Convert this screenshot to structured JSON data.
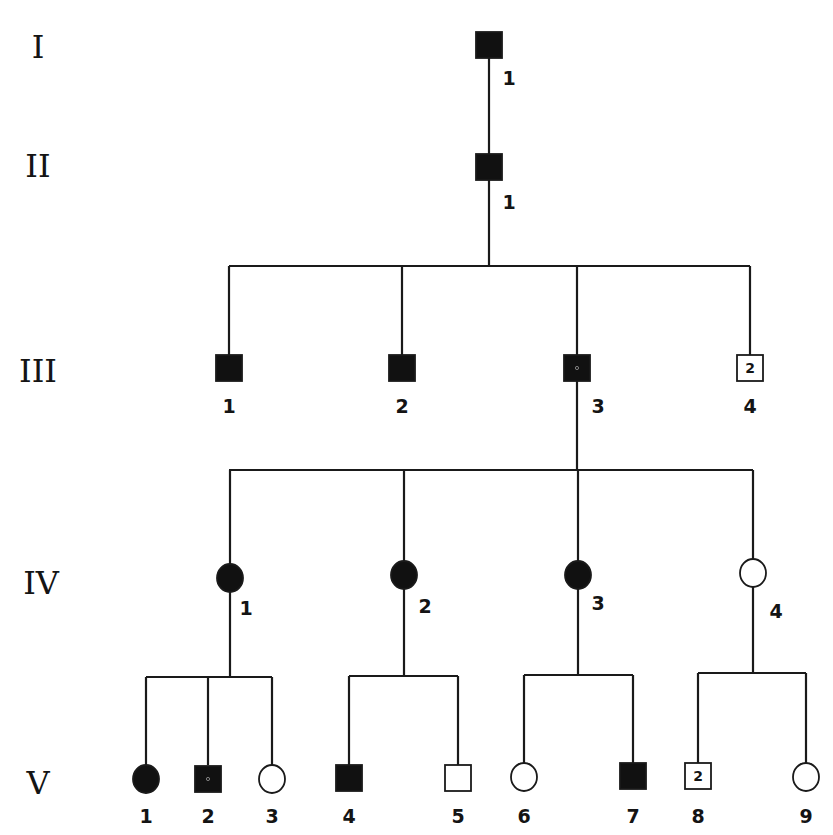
{
  "figure": {
    "type": "pedigree",
    "background": "#ffffff",
    "ink": "#111111"
  },
  "generations": [
    {
      "label": "I",
      "x": 38,
      "y": 58
    },
    {
      "label": "II",
      "x": 38,
      "y": 177
    },
    {
      "label": "III",
      "x": 38,
      "y": 382
    },
    {
      "label": "IV",
      "x": 41,
      "y": 594
    },
    {
      "label": "V",
      "x": 38,
      "y": 794
    }
  ],
  "individuals": [
    {
      "id": "I-1",
      "number": "1",
      "sex": "male",
      "affected": true,
      "x": 489,
      "y": 45,
      "label_x": 509,
      "label_y": 85
    },
    {
      "id": "II-1",
      "number": "1",
      "sex": "male",
      "affected": true,
      "x": 489,
      "y": 167,
      "label_x": 509,
      "label_y": 209
    },
    {
      "id": "III-1",
      "number": "1",
      "sex": "male",
      "affected": true,
      "x": 229,
      "y": 368,
      "label_x": 229,
      "label_y": 413
    },
    {
      "id": "III-2",
      "number": "2",
      "sex": "male",
      "affected": true,
      "x": 402,
      "y": 368,
      "label_x": 402,
      "label_y": 413
    },
    {
      "id": "III-3",
      "number": "3",
      "sex": "male",
      "affected": true,
      "x": 577,
      "y": 368,
      "label_x": 598,
      "label_y": 413,
      "dot": true
    },
    {
      "id": "III-4",
      "number": "4",
      "sex": "male",
      "affected": false,
      "x": 750,
      "y": 368,
      "label_x": 750,
      "label_y": 413,
      "inner": "2"
    },
    {
      "id": "IV-1",
      "number": "1",
      "sex": "female",
      "affected": true,
      "x": 230,
      "y": 578,
      "label_x": 246,
      "label_y": 615
    },
    {
      "id": "IV-2",
      "number": "2",
      "sex": "female",
      "affected": true,
      "x": 404,
      "y": 575,
      "label_x": 425,
      "label_y": 613
    },
    {
      "id": "IV-3",
      "number": "3",
      "sex": "female",
      "affected": true,
      "x": 578,
      "y": 575,
      "label_x": 598,
      "label_y": 610
    },
    {
      "id": "IV-4",
      "number": "4",
      "sex": "female",
      "affected": false,
      "x": 753,
      "y": 573,
      "label_x": 776,
      "label_y": 618
    },
    {
      "id": "V-1",
      "number": "1",
      "sex": "female",
      "affected": true,
      "x": 146,
      "y": 779,
      "label_x": 146,
      "label_y": 823
    },
    {
      "id": "V-2",
      "number": "2",
      "sex": "male",
      "affected": true,
      "x": 208,
      "y": 779,
      "label_x": 208,
      "label_y": 823,
      "dot": true
    },
    {
      "id": "V-3",
      "number": "3",
      "sex": "female",
      "affected": false,
      "x": 272,
      "y": 779,
      "label_x": 272,
      "label_y": 823
    },
    {
      "id": "V-4",
      "number": "4",
      "sex": "male",
      "affected": true,
      "x": 349,
      "y": 778,
      "label_x": 349,
      "label_y": 823
    },
    {
      "id": "V-5",
      "number": "5",
      "sex": "male",
      "affected": false,
      "x": 458,
      "y": 778,
      "label_x": 458,
      "label_y": 823
    },
    {
      "id": "V-6",
      "number": "6",
      "sex": "female",
      "affected": false,
      "x": 524,
      "y": 777,
      "label_x": 524,
      "label_y": 823
    },
    {
      "id": "V-7",
      "number": "7",
      "sex": "male",
      "affected": true,
      "x": 633,
      "y": 776,
      "label_x": 633,
      "label_y": 823
    },
    {
      "id": "V-8",
      "number": "8",
      "sex": "male",
      "affected": false,
      "x": 698,
      "y": 776,
      "label_x": 698,
      "label_y": 823,
      "inner": "2"
    },
    {
      "id": "V-9",
      "number": "9",
      "sex": "female",
      "affected": false,
      "x": 806,
      "y": 777,
      "label_x": 806,
      "label_y": 823
    }
  ],
  "lines": [
    {
      "name": "I1-to-II1",
      "x1": 489,
      "y1": 58,
      "x2": 489,
      "y2": 154
    },
    {
      "name": "II1-descent",
      "x1": 489,
      "y1": 180,
      "x2": 489,
      "y2": 266
    },
    {
      "name": "gen3-sibship",
      "x1": 229,
      "y1": 266,
      "x2": 750,
      "y2": 266
    },
    {
      "name": "III1-drop",
      "x1": 229,
      "y1": 266,
      "x2": 229,
      "y2": 355
    },
    {
      "name": "III2-drop",
      "x1": 402,
      "y1": 266,
      "x2": 402,
      "y2": 355
    },
    {
      "name": "III3-drop",
      "x1": 577,
      "y1": 266,
      "x2": 577,
      "y2": 355
    },
    {
      "name": "III4-drop",
      "x1": 750,
      "y1": 266,
      "x2": 750,
      "y2": 355
    },
    {
      "name": "III3-descent",
      "x1": 577,
      "y1": 381,
      "x2": 577,
      "y2": 470
    },
    {
      "name": "gen4-sibship",
      "x1": 229,
      "y1": 470,
      "x2": 753,
      "y2": 470
    },
    {
      "name": "IV1-drop",
      "x1": 230,
      "y1": 470,
      "x2": 230,
      "y2": 565
    },
    {
      "name": "IV2-drop",
      "x1": 404,
      "y1": 470,
      "x2": 404,
      "y2": 562
    },
    {
      "name": "IV3-drop",
      "x1": 578,
      "y1": 470,
      "x2": 578,
      "y2": 562
    },
    {
      "name": "IV4-drop",
      "x1": 753,
      "y1": 470,
      "x2": 753,
      "y2": 560
    },
    {
      "name": "IV1-descent",
      "x1": 230,
      "y1": 591,
      "x2": 230,
      "y2": 677
    },
    {
      "name": "IV1-sibship",
      "x1": 146,
      "y1": 677,
      "x2": 272,
      "y2": 677
    },
    {
      "name": "V1-drop",
      "x1": 146,
      "y1": 677,
      "x2": 146,
      "y2": 766
    },
    {
      "name": "V2-drop",
      "x1": 208,
      "y1": 677,
      "x2": 208,
      "y2": 765
    },
    {
      "name": "V3-drop",
      "x1": 272,
      "y1": 677,
      "x2": 272,
      "y2": 766
    },
    {
      "name": "IV2-descent",
      "x1": 404,
      "y1": 588,
      "x2": 404,
      "y2": 676
    },
    {
      "name": "IV2-sibship",
      "x1": 349,
      "y1": 676,
      "x2": 458,
      "y2": 676
    },
    {
      "name": "V4-drop",
      "x1": 349,
      "y1": 676,
      "x2": 349,
      "y2": 765
    },
    {
      "name": "V5-drop",
      "x1": 458,
      "y1": 676,
      "x2": 458,
      "y2": 765
    },
    {
      "name": "IV3-descent",
      "x1": 578,
      "y1": 588,
      "x2": 578,
      "y2": 675
    },
    {
      "name": "IV3-sibship",
      "x1": 524,
      "y1": 675,
      "x2": 633,
      "y2": 675
    },
    {
      "name": "V6-drop",
      "x1": 524,
      "y1": 675,
      "x2": 524,
      "y2": 764
    },
    {
      "name": "V7-drop",
      "x1": 633,
      "y1": 675,
      "x2": 633,
      "y2": 763
    },
    {
      "name": "IV4-descent",
      "x1": 753,
      "y1": 586,
      "x2": 753,
      "y2": 673
    },
    {
      "name": "IV4-sibship",
      "x1": 698,
      "y1": 673,
      "x2": 806,
      "y2": 673
    },
    {
      "name": "V8-drop",
      "x1": 698,
      "y1": 673,
      "x2": 698,
      "y2": 763
    },
    {
      "name": "V9-drop",
      "x1": 806,
      "y1": 673,
      "x2": 806,
      "y2": 764
    }
  ],
  "symbol_size": {
    "square": 26,
    "circle_r": 13
  }
}
